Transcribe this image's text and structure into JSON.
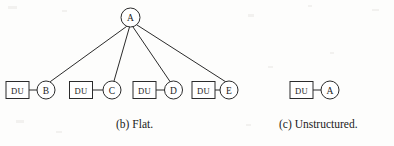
{
  "figure": {
    "background_color": "#fdfdfc",
    "ink_color": "#2b2b2b",
    "node_fill_color": "#ffffff"
  },
  "panels": [
    {
      "id": "flat",
      "caption": "(b) Flat.",
      "root": {
        "label": "A",
        "shape": "circle",
        "cx": 130.5,
        "cy": 17.5,
        "r": 9.5
      },
      "leaves": [
        {
          "circle_label": "B",
          "box_label": "DU",
          "box": {
            "x": 6,
            "y": 81.5,
            "w": 23,
            "h": 17
          },
          "circle": {
            "cx": 46,
            "cy": 90,
            "r": 9
          },
          "connector": {
            "x1": 29,
            "y1": 90,
            "x2": 37,
            "y2": 90
          }
        },
        {
          "circle_label": "C",
          "box_label": "DU",
          "box": {
            "x": 69.5,
            "y": 81.5,
            "w": 23,
            "h": 17
          },
          "circle": {
            "cx": 112,
            "cy": 90,
            "r": 9
          },
          "connector": {
            "x1": 92.5,
            "y1": 90,
            "x2": 103,
            "y2": 90
          }
        },
        {
          "circle_label": "D",
          "box_label": "DU",
          "box": {
            "x": 133,
            "y": 81.5,
            "w": 23,
            "h": 17
          },
          "circle": {
            "cx": 173.5,
            "cy": 90,
            "r": 9
          },
          "connector": {
            "x1": 156,
            "y1": 90,
            "x2": 164.5,
            "y2": 90
          }
        },
        {
          "circle_label": "E",
          "box_label": "DU",
          "box": {
            "x": 192,
            "y": 81.5,
            "w": 23,
            "h": 17
          },
          "circle": {
            "cx": 229,
            "cy": 90,
            "r": 9
          },
          "connector": {
            "x1": 215,
            "y1": 90,
            "x2": 220,
            "y2": 90
          }
        }
      ],
      "edges": [
        {
          "from": "A",
          "to": "B",
          "x1": 126.5,
          "y1": 26.5,
          "x2": 50.5,
          "y2": 81.5
        },
        {
          "from": "A",
          "to": "C",
          "x1": 129.5,
          "y1": 27,
          "x2": 114,
          "y2": 81
        },
        {
          "from": "A",
          "to": "D",
          "x1": 133,
          "y1": 27,
          "x2": 170,
          "y2": 81.5
        },
        {
          "from": "A",
          "to": "E",
          "x1": 137,
          "y1": 25,
          "x2": 226,
          "y2": 82
        }
      ]
    },
    {
      "id": "unstructured",
      "caption": "(c) Unstructured.",
      "leaves": [
        {
          "circle_label": "A",
          "box_label": "DU",
          "box": {
            "x": 290,
            "y": 81.5,
            "w": 23,
            "h": 17
          },
          "circle": {
            "cx": 330,
            "cy": 90,
            "r": 9
          },
          "connector": {
            "x1": 313,
            "y1": 90,
            "x2": 321,
            "y2": 90
          }
        }
      ]
    }
  ]
}
